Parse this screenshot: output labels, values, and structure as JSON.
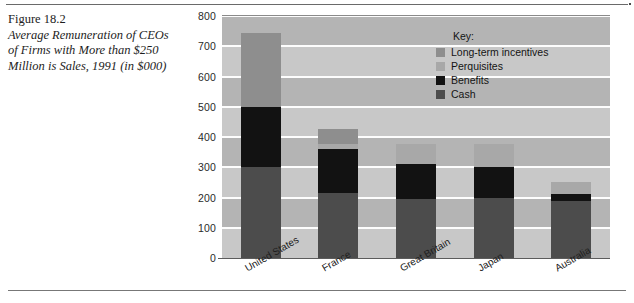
{
  "caption": {
    "figure_number": "Figure 18.2",
    "description": "Average Remuneration of CEOs of Firms with More than $250 Million is Sales, 1991 (in $000)"
  },
  "legend": {
    "title": "Key:",
    "items": [
      {
        "label": "Long-term incentives",
        "color": "#8e8e8e"
      },
      {
        "label": "Perquisites",
        "color": "#a8a8a8"
      },
      {
        "label": "Benefits",
        "color": "#121212"
      },
      {
        "label": "Cash",
        "color": "#4c4c4c"
      }
    ]
  },
  "chart_data": {
    "type": "bar",
    "stacked": true,
    "title": "",
    "xlabel": "",
    "ylabel": "",
    "ylim": [
      0,
      800
    ],
    "yticks": [
      0,
      100,
      200,
      300,
      400,
      500,
      600,
      700,
      800
    ],
    "grid": true,
    "legend_position": "inside-top-right",
    "categories": [
      "United States",
      "France",
      "Great Britain",
      "Japan",
      "Australia"
    ],
    "series": [
      {
        "name": "Cash",
        "color": "#4c4c4c",
        "values": [
          300,
          215,
          195,
          200,
          190
        ]
      },
      {
        "name": "Benefits",
        "color": "#121212",
        "values": [
          200,
          145,
          115,
          100,
          22
        ]
      },
      {
        "name": "Perquisites",
        "color": "#a8a8a8",
        "values": [
          0,
          18,
          68,
          78,
          40
        ]
      },
      {
        "name": "Long-term incentives",
        "color": "#8e8e8e",
        "values": [
          245,
          47,
          0,
          0,
          0
        ]
      }
    ],
    "totals": [
      745,
      425,
      378,
      378,
      252
    ]
  },
  "colors": {
    "plot_background": "#b4b4b4",
    "plot_band": "#c8c8c8",
    "gridline": "#fdfdfd",
    "axis": "#5c5c5c"
  }
}
